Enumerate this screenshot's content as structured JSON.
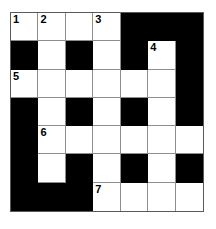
{
  "puzzle": {
    "type": "crossword-grid",
    "columns": 7,
    "rows": 7,
    "colors": {
      "block": "#000000",
      "open": "#ffffff",
      "grid_line": "#8d8d8d",
      "frame": "#5a5a5a",
      "number_text": "#000000"
    },
    "legend": {
      "block_label": "blocked square",
      "open_label": "open square"
    },
    "cells": [
      [
        {
          "state": "open",
          "number": "1"
        },
        {
          "state": "open",
          "number": "2"
        },
        {
          "state": "open",
          "number": ""
        },
        {
          "state": "open",
          "number": "3"
        },
        {
          "state": "block",
          "number": ""
        },
        {
          "state": "block",
          "number": ""
        },
        {
          "state": "block",
          "number": ""
        }
      ],
      [
        {
          "state": "block",
          "number": ""
        },
        {
          "state": "open",
          "number": ""
        },
        {
          "state": "block",
          "number": ""
        },
        {
          "state": "open",
          "number": ""
        },
        {
          "state": "block",
          "number": ""
        },
        {
          "state": "open",
          "number": "4"
        },
        {
          "state": "block",
          "number": ""
        }
      ],
      [
        {
          "state": "open",
          "number": "5"
        },
        {
          "state": "open",
          "number": ""
        },
        {
          "state": "open",
          "number": ""
        },
        {
          "state": "open",
          "number": ""
        },
        {
          "state": "open",
          "number": ""
        },
        {
          "state": "open",
          "number": ""
        },
        {
          "state": "block",
          "number": ""
        }
      ],
      [
        {
          "state": "block",
          "number": ""
        },
        {
          "state": "open",
          "number": ""
        },
        {
          "state": "block",
          "number": ""
        },
        {
          "state": "open",
          "number": ""
        },
        {
          "state": "block",
          "number": ""
        },
        {
          "state": "open",
          "number": ""
        },
        {
          "state": "block",
          "number": ""
        }
      ],
      [
        {
          "state": "block",
          "number": ""
        },
        {
          "state": "open",
          "number": "6"
        },
        {
          "state": "open",
          "number": ""
        },
        {
          "state": "open",
          "number": ""
        },
        {
          "state": "open",
          "number": ""
        },
        {
          "state": "open",
          "number": ""
        },
        {
          "state": "open",
          "number": ""
        }
      ],
      [
        {
          "state": "block",
          "number": ""
        },
        {
          "state": "open",
          "number": ""
        },
        {
          "state": "block",
          "number": ""
        },
        {
          "state": "open",
          "number": ""
        },
        {
          "state": "block",
          "number": ""
        },
        {
          "state": "open",
          "number": ""
        },
        {
          "state": "block",
          "number": ""
        }
      ],
      [
        {
          "state": "block",
          "number": ""
        },
        {
          "state": "block",
          "number": ""
        },
        {
          "state": "block",
          "number": ""
        },
        {
          "state": "open",
          "number": "7"
        },
        {
          "state": "open",
          "number": ""
        },
        {
          "state": "open",
          "number": ""
        },
        {
          "state": "open",
          "number": ""
        }
      ]
    ]
  }
}
